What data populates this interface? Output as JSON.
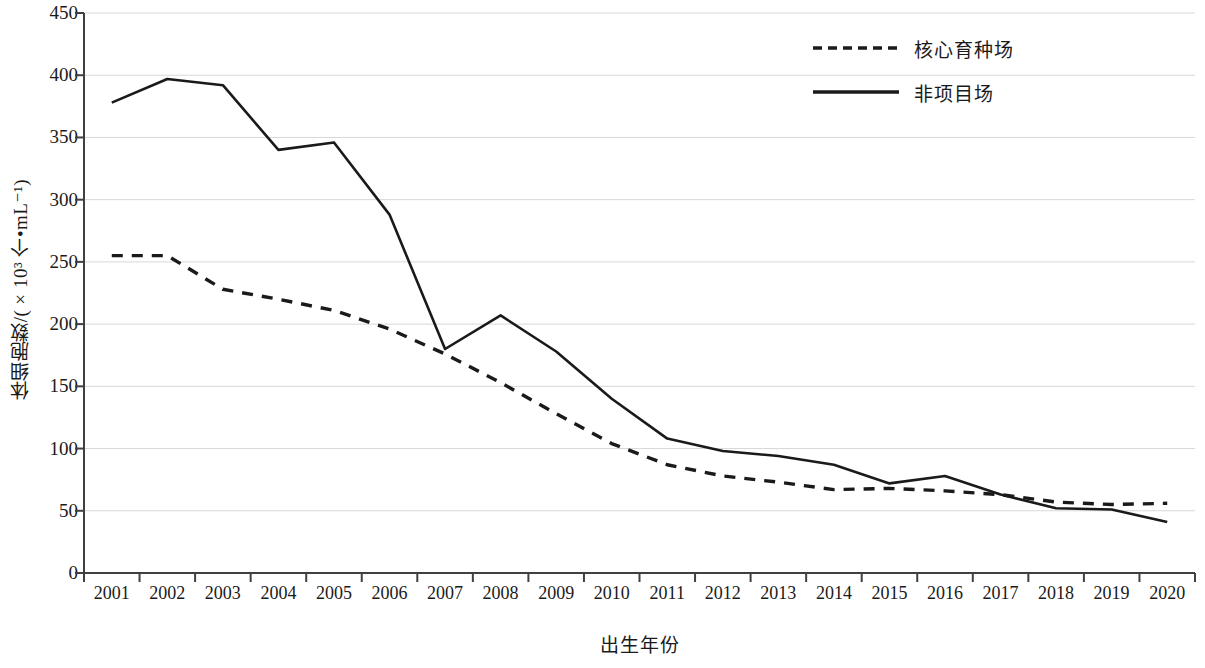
{
  "chart_data": {
    "type": "line",
    "title": "",
    "xlabel": "出生年份",
    "ylabel": "体细胞数/(×10³ 个•mL⁻¹)",
    "categories": [
      "2001",
      "2002",
      "2003",
      "2004",
      "2005",
      "2006",
      "2007",
      "2008",
      "2009",
      "2010",
      "2011",
      "2012",
      "2013",
      "2014",
      "2015",
      "2016",
      "2017",
      "2018",
      "2019",
      "2020"
    ],
    "ylim": [
      0,
      450
    ],
    "ytick_values": [
      0,
      50,
      100,
      150,
      200,
      250,
      300,
      350,
      400,
      450
    ],
    "ytick_labels": [
      "0",
      "50",
      "100",
      "150",
      "200",
      "250",
      "300",
      "350",
      "400",
      "450"
    ],
    "grid": "horizontal",
    "legend_position": "top-right",
    "series": [
      {
        "name": "核心育种场",
        "style": "dashed",
        "color": "#1a1a1a",
        "values": [
          255,
          255,
          228,
          220,
          211,
          196,
          176,
          153,
          128,
          104,
          87,
          78,
          73,
          67,
          68,
          66,
          63,
          57,
          55,
          56
        ]
      },
      {
        "name": "非项目场",
        "style": "solid",
        "color": "#1a1a1a",
        "values": [
          378,
          397,
          392,
          340,
          346,
          288,
          180,
          207,
          178,
          140,
          108,
          98,
          94,
          87,
          72,
          78,
          63,
          52,
          51,
          41
        ]
      }
    ]
  },
  "legend": {
    "items": [
      {
        "label": "核心育种场",
        "style": "dashed"
      },
      {
        "label": "非项目场",
        "style": "solid"
      }
    ]
  }
}
